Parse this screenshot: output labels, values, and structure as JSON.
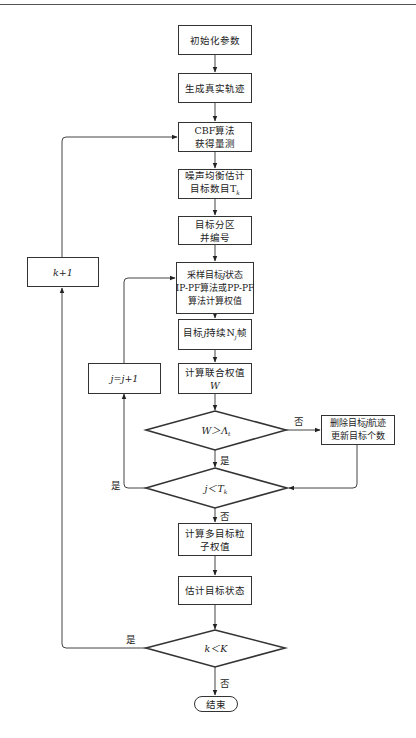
{
  "diagram": {
    "type": "flowchart",
    "nodes": {
      "init": {
        "label": "初始化参数"
      },
      "generate": {
        "label": "生成真实轨迹"
      },
      "cbf": {
        "line1": "CBF算法",
        "line2": "获得量测"
      },
      "noise": {
        "line1": "噪声均衡估计",
        "line2": "目标数目T",
        "line2_sub": "k"
      },
      "partition": {
        "line1": "目标分区",
        "line2": "并编号"
      },
      "sample": {
        "line1_pre": "采样目标",
        "line1_var": "j",
        "line1_post": "状态",
        "line2": "IP-PF算法或PP-PF",
        "line3": "算法计算权值"
      },
      "persist": {
        "pre": "目标",
        "var": "j",
        "mid": "持续N",
        "sub": "j",
        "post": "帧"
      },
      "joint_weight": {
        "line1": "计算联合权值",
        "line2": "W"
      },
      "cond_w": {
        "label": "W＞Λ",
        "sub": "t"
      },
      "delete": {
        "line1_pre": "删除目标",
        "line1_var": "j",
        "line1_post": "航迹",
        "line2": "更新目标个数"
      },
      "cond_j": {
        "label": "j＜T",
        "sub": "k"
      },
      "j_inc": {
        "label": "j=j+1"
      },
      "multi_weight": {
        "line1": "计算多目标粒",
        "line2": "子权值"
      },
      "estimate": {
        "label": "估计目标状态"
      },
      "cond_k": {
        "label": "k＜K"
      },
      "k_inc": {
        "label": "k+1"
      },
      "end": {
        "label": "结束"
      }
    },
    "edge_labels": {
      "cond_w_no": "否",
      "cond_w_yes": "是",
      "cond_j_yes": "是",
      "cond_j_no": "否",
      "cond_k_yes": "是",
      "cond_k_no": "否"
    }
  }
}
